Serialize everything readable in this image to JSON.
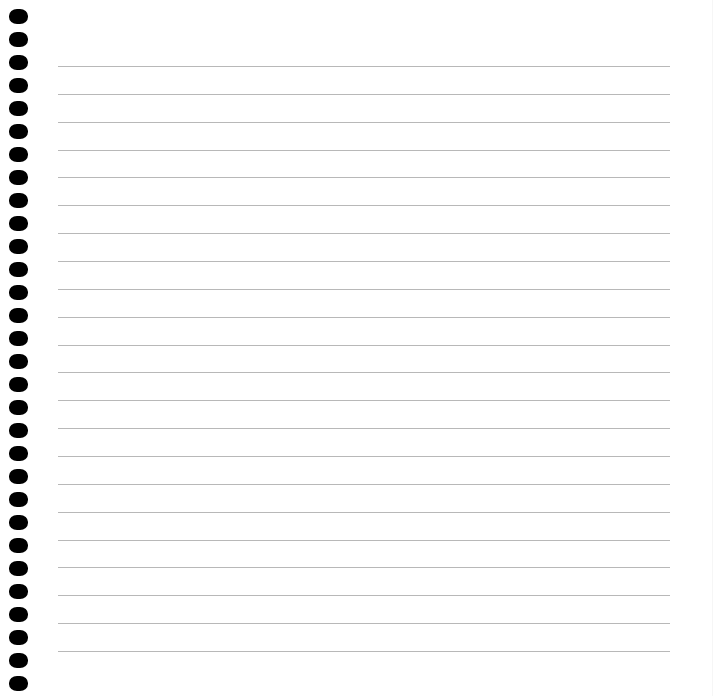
{
  "page": {
    "type": "spiral-notebook-lined-paper",
    "background_color": "#ffffff"
  },
  "binding": {
    "hole_count": 30,
    "hole_color": "#000000",
    "first_hole_top": 9,
    "hole_spacing": 23
  },
  "ruled_lines": {
    "count": 22,
    "line_color": "#b8b8b8",
    "first_line_y": 66,
    "line_spacing": 27.86,
    "left": 58,
    "right": 670
  }
}
